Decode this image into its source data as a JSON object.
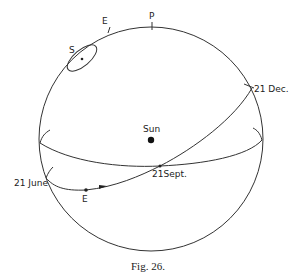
{
  "figure": {
    "caption": "Fig. 26.",
    "labels": {
      "pole": "P",
      "earth_top": "E",
      "star": "S",
      "sun": "Sun",
      "dec": "21 Dec.",
      "sept": "21Sept.",
      "june": "21 June",
      "earth_orbit": "E"
    },
    "colors": {
      "ink": "#333333",
      "background": "#ffffff"
    }
  }
}
